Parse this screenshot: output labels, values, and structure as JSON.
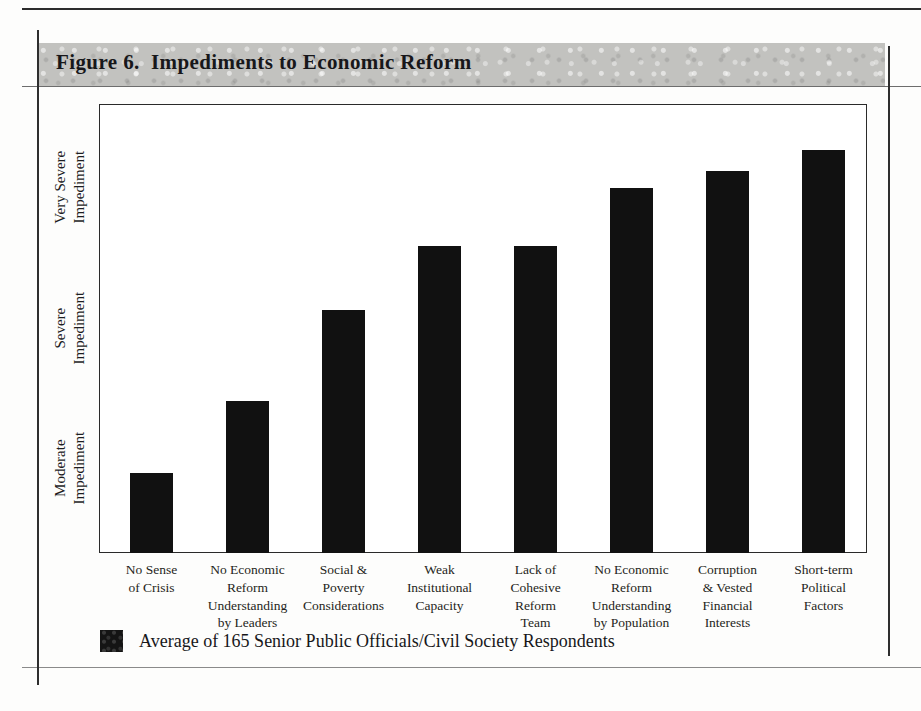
{
  "figure": {
    "title": "Figure 6.  Impediments to Economic Reform"
  },
  "chart_data": {
    "type": "bar",
    "title": "Figure 6.  Impediments to Economic Reform",
    "xlabel": "",
    "ylabel": "",
    "grid": false,
    "legend_position": "bottom-left",
    "y_tick_labels": [
      "Moderate\nImpediment",
      "Severe\nImpediment",
      "Very Severe\nImpediment"
    ],
    "y_tick_values": [
      2,
      3,
      4
    ],
    "ylim": [
      1.4,
      4.6
    ],
    "categories": [
      "No Sense\nof Crisis",
      "No Economic\nReform\nUnderstanding\nby Leaders",
      "Social &\nPoverty\nConsiderations",
      "Weak\nInstitutional\nCapacity",
      "Lack of\nCohesive\nReform\nTeam",
      "No Economic\nReform\nUnderstanding\nby Population",
      "Corruption\n& Vested\nFinancial\nInterests",
      "Short-term\nPolitical\nFactors"
    ],
    "series": [
      {
        "name": "Average of 165 Senior Public Officials/Civil Society Respondents",
        "color": "#111111",
        "values": [
          1.97,
          2.48,
          3.13,
          3.59,
          3.59,
          4.0,
          4.12,
          4.27
        ]
      }
    ]
  },
  "legend": {
    "label": "Average of 165 Senior Public Officials/Civil Society Respondents"
  }
}
